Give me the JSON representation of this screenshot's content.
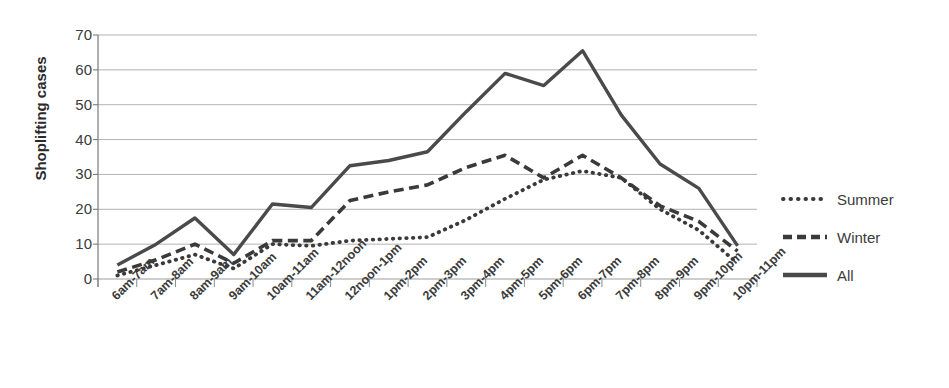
{
  "chart_data": {
    "type": "line",
    "title": "",
    "xlabel": "",
    "ylabel": "Shoplifting cases",
    "ylim": [
      0,
      70
    ],
    "ytick_step": 10,
    "grid": true,
    "legend_position": "right",
    "categories": [
      "6am-7am",
      "7am-8am",
      "8am-9am",
      "9am-10am",
      "10am-11am",
      "11am-12noon",
      "12noon-1pm",
      "1pm-2pm",
      "2pm-3pm",
      "3pm-4pm",
      "4pm-5pm",
      "5pm-6pm",
      "6pm-7pm",
      "7pm-8pm",
      "8pm-9pm",
      "9pm-10pm",
      "10pm-11pm"
    ],
    "yticks": [
      0,
      10,
      20,
      30,
      40,
      50,
      60,
      70
    ],
    "series": [
      {
        "name": "Summer",
        "style": "dotted",
        "color": "#3a3a3a",
        "values": [
          1,
          4,
          7,
          3,
          10,
          9.5,
          11,
          11.5,
          12,
          17,
          23,
          28.5,
          31,
          29,
          20,
          14,
          4.5
        ]
      },
      {
        "name": "Winter",
        "style": "dashed",
        "color": "#3a3a3a",
        "values": [
          2,
          5.5,
          10,
          4.5,
          11,
          11,
          22.5,
          25,
          27,
          32,
          35.5,
          29,
          35.5,
          29,
          21,
          16.5,
          8
        ]
      },
      {
        "name": "All",
        "style": "solid",
        "color": "#4a4a4a",
        "values": [
          4,
          10,
          17.5,
          7,
          21.5,
          20.5,
          32.5,
          34,
          36.5,
          48,
          59,
          55.5,
          65.5,
          47,
          33,
          26,
          9.5
        ]
      }
    ]
  },
  "legend": {
    "items": [
      {
        "label": "Summer",
        "style": "dotted"
      },
      {
        "label": "Winter",
        "style": "dashed"
      },
      {
        "label": "All",
        "style": "solid"
      }
    ]
  }
}
